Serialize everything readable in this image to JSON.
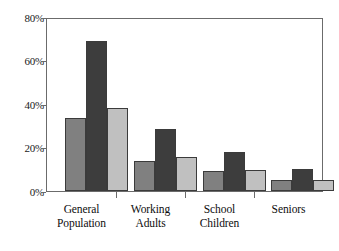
{
  "chart_data": {
    "type": "bar",
    "title": "",
    "subtitle": "",
    "xlabel": "",
    "ylabel": "",
    "ylim": [
      0,
      80
    ],
    "yticks": [
      0,
      20,
      40,
      60,
      80
    ],
    "ytick_labels": [
      "0%",
      "20%",
      "40%",
      "60%",
      "80%"
    ],
    "grid": false,
    "legend": false,
    "legend_position": "none",
    "value_format": "percent",
    "categories": [
      "General Population",
      "Working Adults",
      "School Children",
      "Seniors"
    ],
    "category_lines": [
      [
        "General",
        "Population"
      ],
      [
        "Working",
        "Adults"
      ],
      [
        "School",
        "Children"
      ],
      [
        "Seniors",
        ""
      ]
    ],
    "series": [
      {
        "name": "Series 1",
        "color": "#808080",
        "values": [
          33.5,
          14.0,
          9.0,
          5.0
        ]
      },
      {
        "name": "Series 2",
        "color": "#3d3d3d",
        "values": [
          69.0,
          28.5,
          18.0,
          10.0
        ]
      },
      {
        "name": "Series 3",
        "color": "#c0c0c0",
        "values": [
          38.0,
          15.5,
          9.5,
          5.0
        ]
      }
    ]
  },
  "style": {
    "plot_background": "#ffffff",
    "frame_color": "#6b6b6b",
    "bar_outline": "#3b3b3b",
    "text_color": "#0d0d0d"
  }
}
